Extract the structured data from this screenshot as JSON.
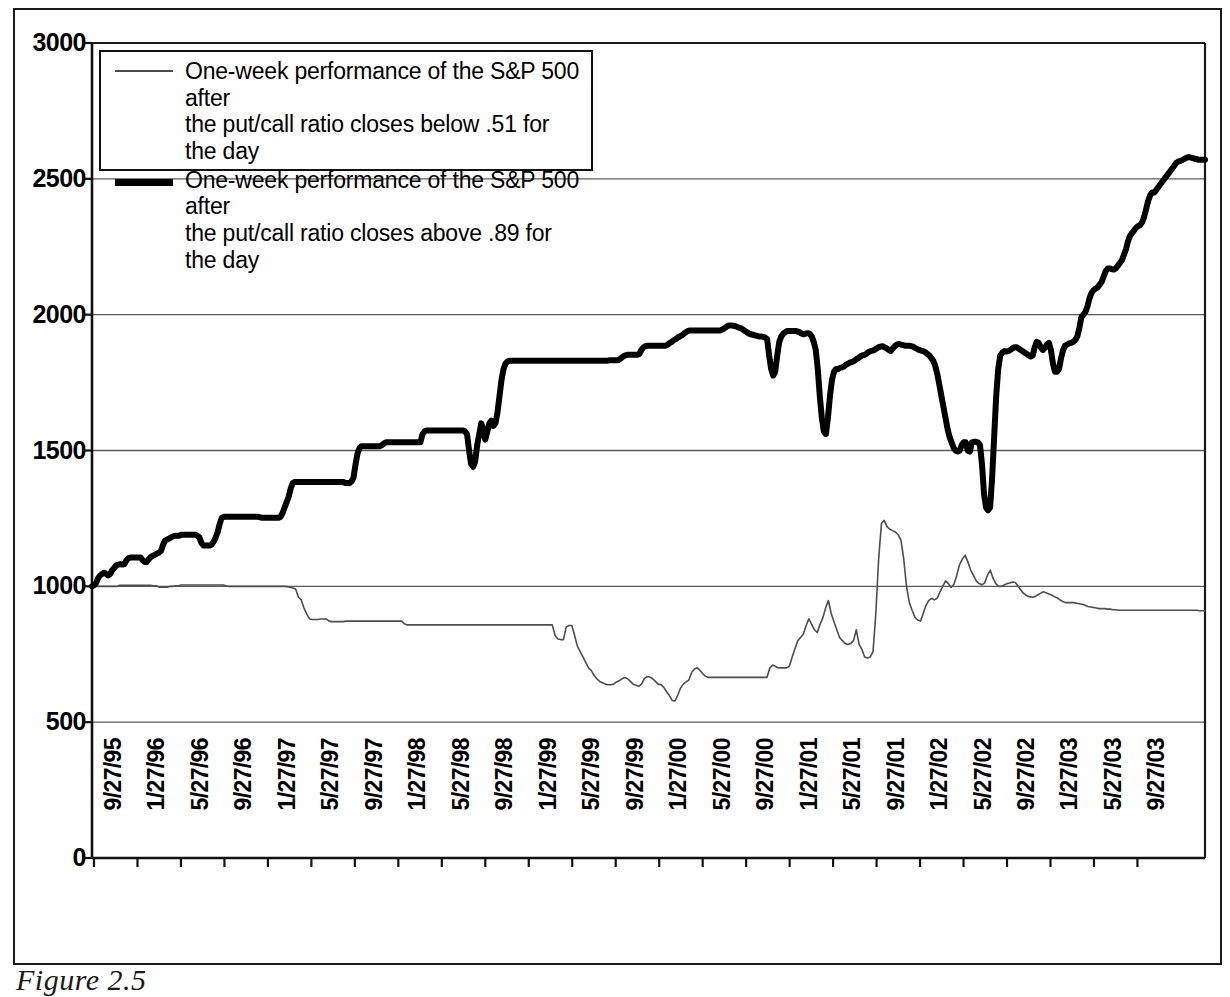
{
  "figure": {
    "caption": "Figure 2.5"
  },
  "legend": {
    "position": "top-left",
    "entries": [
      {
        "style": "thin",
        "line1": "One-week performance of the S&P 500 after",
        "line2": "the put/call ratio closes below .51 for the day",
        "color": "#4d4d4d"
      },
      {
        "style": "thick",
        "line1": "One-week performance of the S&P 500 after",
        "line2": "the put/call ratio closes above .89 for the day",
        "color": "#000000"
      }
    ]
  },
  "chart_data": {
    "type": "line",
    "title": "",
    "subtitle": "",
    "xlabel": "",
    "ylabel": "",
    "grid": "horizontal",
    "ylim": [
      0,
      3000
    ],
    "yticks": [
      0,
      500,
      1000,
      1500,
      2000,
      2500,
      3000
    ],
    "ytick_labels": [
      "0",
      "500",
      "1000",
      "1500",
      "2000",
      "2500",
      "3000"
    ],
    "xtick_labels": [
      "9/27/95",
      "1/27/96",
      "5/27/96",
      "9/27/96",
      "1/27/97",
      "5/27/97",
      "9/27/97",
      "1/27/98",
      "5/27/98",
      "9/27/98",
      "1/27/99",
      "5/27/99",
      "9/27/99",
      "1/27/00",
      "5/27/00",
      "9/27/00",
      "1/27/01",
      "5/27/01",
      "9/27/01",
      "1/27/02",
      "5/27/02",
      "9/27/02",
      "1/27/03",
      "5/27/03",
      "9/27/03"
    ],
    "x_start": "9/27/95",
    "x_end": "1/27/04",
    "series": [
      {
        "name": "One-week performance of the S&P 500 after the put/call ratio closes below .51 for the day",
        "style": "thin",
        "color": "#4d4d4d",
        "line_width": 1.6,
        "start_value": 1000,
        "end_value": 910,
        "min_value": 578,
        "max_value": 1243,
        "values": [
          1000,
          1000,
          1000,
          1000,
          1000,
          1000,
          1000,
          1000,
          1000,
          1000,
          1004,
          1004,
          1004,
          1004,
          1004,
          1004,
          1004,
          1004,
          1004,
          1004,
          1004,
          1004,
          1002,
          1002,
          997,
          997,
          997,
          997,
          1000,
          1000,
          1002,
          1002,
          1005,
          1005,
          1005,
          1005,
          1005,
          1005,
          1005,
          1005,
          1005,
          1005,
          1005,
          1005,
          1005,
          1005,
          1005,
          1005,
          1002,
          1000,
          1000,
          1000,
          1000,
          1000,
          1000,
          1000,
          1000,
          1000,
          1000,
          1000,
          1000,
          1000,
          1000,
          1000,
          1000,
          1000,
          1000,
          1000,
          1000,
          1000,
          999,
          997,
          994,
          990,
          960,
          950,
          920,
          898,
          880,
          878,
          878,
          878,
          880,
          880,
          880,
          872,
          870,
          870,
          870,
          870,
          870,
          872,
          872,
          872,
          872,
          872,
          872,
          872,
          872,
          872,
          872,
          872,
          872,
          872,
          872,
          872,
          872,
          872,
          872,
          872,
          872,
          872,
          862,
          858,
          858,
          858,
          858,
          858,
          858,
          858,
          858,
          858,
          858,
          858,
          858,
          858,
          858,
          858,
          858,
          858,
          858,
          858,
          858,
          858,
          858,
          858,
          858,
          858,
          858,
          858,
          858,
          858,
          858,
          858,
          858,
          858,
          858,
          858,
          858,
          858,
          858,
          858,
          858,
          858,
          858,
          858,
          858,
          858,
          858,
          858,
          858,
          858,
          858,
          858,
          858,
          858,
          820,
          806,
          804,
          804,
          850,
          856,
          856,
          820,
          780,
          760,
          740,
          720,
          700,
          690,
          672,
          660,
          650,
          645,
          640,
          638,
          638,
          640,
          648,
          652,
          660,
          664,
          660,
          650,
          640,
          636,
          632,
          640,
          660,
          668,
          666,
          660,
          650,
          640,
          638,
          628,
          612,
          598,
          580,
          578,
          600,
          626,
          640,
          648,
          656,
          684,
          696,
          700,
          690,
          678,
          668,
          665,
          665,
          665,
          665,
          665,
          665,
          665,
          665,
          665,
          665,
          665,
          665,
          665,
          665,
          665,
          665,
          665,
          665,
          665,
          665,
          665,
          665,
          700,
          710,
          706,
          700,
          700,
          700,
          700,
          706,
          740,
          770,
          800,
          812,
          824,
          856,
          880,
          860,
          840,
          830,
          860,
          884,
          920,
          948,
          900,
          870,
          840,
          812,
          800,
          790,
          786,
          790,
          800,
          840,
          786,
          768,
          740,
          736,
          740,
          760,
          900,
          1100,
          1230,
          1243,
          1220,
          1210,
          1205,
          1200,
          1190,
          1170,
          1100,
          1000,
          940,
          912,
          886,
          876,
          872,
          900,
          930,
          948,
          956,
          950,
          956,
          980,
          1000,
          1020,
          1010,
          996,
          1008,
          1040,
          1080,
          1100,
          1115,
          1090,
          1060,
          1040,
          1020,
          1010,
          1006,
          1012,
          1040,
          1060,
          1030,
          1010,
          1000,
          1000,
          1005,
          1010,
          1012,
          1016,
          1014,
          1000,
          986,
          974,
          966,
          962,
          960,
          962,
          968,
          974,
          980,
          976,
          972,
          968,
          962,
          958,
          950,
          944,
          940,
          940,
          940,
          940,
          938,
          936,
          934,
          930,
          926,
          924,
          922,
          920,
          918,
          918,
          918,
          916,
          916,
          914,
          914,
          912,
          912,
          912,
          912,
          912,
          912,
          912,
          912,
          912,
          912,
          912,
          912,
          912,
          912,
          912,
          912,
          912,
          912,
          912,
          912,
          912,
          912,
          912,
          912,
          912,
          912,
          912,
          912,
          912,
          910,
          910,
          910
        ]
      },
      {
        "name": "One-week performance of the S&P 500 after the put/call ratio closes above .89 for the day",
        "style": "thick",
        "color": "#000000",
        "line_width": 6,
        "start_value": 1000,
        "end_value": 2570,
        "min_value": 1000,
        "max_value": 2580,
        "values": [
          1000,
          1004,
          1012,
          1030,
          1040,
          1046,
          1050,
          1046,
          1040,
          1046,
          1060,
          1068,
          1078,
          1080,
          1082,
          1080,
          1082,
          1096,
          1104,
          1106,
          1106,
          1106,
          1106,
          1106,
          1106,
          1096,
          1090,
          1090,
          1100,
          1108,
          1112,
          1116,
          1120,
          1124,
          1130,
          1152,
          1168,
          1172,
          1176,
          1180,
          1184,
          1186,
          1186,
          1186,
          1190,
          1190,
          1190,
          1190,
          1190,
          1190,
          1190,
          1190,
          1186,
          1180,
          1160,
          1150,
          1150,
          1150,
          1150,
          1154,
          1164,
          1180,
          1200,
          1230,
          1252,
          1256,
          1256,
          1256,
          1256,
          1256,
          1256,
          1256,
          1256,
          1256,
          1256,
          1256,
          1256,
          1256,
          1256,
          1256,
          1256,
          1256,
          1256,
          1254,
          1252,
          1252,
          1252,
          1252,
          1252,
          1252,
          1252,
          1252,
          1252,
          1256,
          1270,
          1290,
          1310,
          1330,
          1360,
          1380,
          1384,
          1384,
          1384,
          1384,
          1384,
          1384,
          1384,
          1384,
          1384,
          1384,
          1384,
          1384,
          1384,
          1384,
          1384,
          1384,
          1384,
          1384,
          1384,
          1384,
          1384,
          1384,
          1384,
          1384,
          1384,
          1380,
          1380,
          1380,
          1386,
          1400,
          1450,
          1490,
          1510,
          1516,
          1516,
          1516,
          1516,
          1516,
          1516,
          1516,
          1516,
          1516,
          1516,
          1520,
          1526,
          1530,
          1530,
          1530,
          1530,
          1530,
          1530,
          1530,
          1530,
          1530,
          1530,
          1530,
          1530,
          1530,
          1530,
          1530,
          1530,
          1530,
          1530,
          1560,
          1570,
          1574,
          1574,
          1574,
          1574,
          1574,
          1574,
          1574,
          1574,
          1574,
          1574,
          1574,
          1574,
          1574,
          1574,
          1574,
          1574,
          1574,
          1574,
          1574,
          1570,
          1560,
          1500,
          1450,
          1440,
          1460,
          1520,
          1560,
          1600,
          1575,
          1540,
          1570,
          1600,
          1610,
          1590,
          1600,
          1640,
          1700,
          1760,
          1800,
          1820,
          1828,
          1830,
          1830,
          1830,
          1830,
          1830,
          1830,
          1830,
          1830,
          1830,
          1830,
          1830,
          1830,
          1830,
          1830,
          1830,
          1830,
          1830,
          1830,
          1830,
          1830,
          1830,
          1830,
          1830,
          1830,
          1830,
          1830,
          1830,
          1830,
          1830,
          1830,
          1830,
          1830,
          1830,
          1830,
          1830,
          1830,
          1830,
          1830,
          1830,
          1830,
          1830,
          1830,
          1830,
          1830,
          1830,
          1830,
          1830,
          1830,
          1830,
          1832,
          1832,
          1832,
          1832,
          1832,
          1834,
          1840,
          1846,
          1850,
          1852,
          1852,
          1852,
          1852,
          1852,
          1852,
          1856,
          1870,
          1880,
          1884,
          1886,
          1886,
          1886,
          1886,
          1886,
          1886,
          1886,
          1886,
          1886,
          1886,
          1890,
          1896,
          1900,
          1906,
          1910,
          1916,
          1920,
          1924,
          1930,
          1936,
          1940,
          1942,
          1942,
          1942,
          1942,
          1942,
          1942,
          1942,
          1942,
          1942,
          1942,
          1942,
          1942,
          1942,
          1942,
          1942,
          1942,
          1946,
          1950,
          1956,
          1960,
          1960,
          1960,
          1958,
          1956,
          1952,
          1950,
          1946,
          1940,
          1936,
          1930,
          1928,
          1926,
          1924,
          1922,
          1920,
          1920,
          1918,
          1916,
          1910,
          1850,
          1800,
          1776,
          1790,
          1850,
          1900,
          1920,
          1930,
          1936,
          1940,
          1940,
          1940,
          1940,
          1940,
          1938,
          1936,
          1930,
          1928,
          1930,
          1932,
          1930,
          1920,
          1900,
          1870,
          1800,
          1700,
          1620,
          1570,
          1560,
          1620,
          1700,
          1760,
          1790,
          1800,
          1800,
          1804,
          1806,
          1810,
          1816,
          1820,
          1824,
          1826,
          1830,
          1836,
          1840,
          1846,
          1850,
          1852,
          1856,
          1862,
          1866,
          1868,
          1870,
          1876,
          1880,
          1882,
          1884,
          1880,
          1876,
          1870,
          1866,
          1876,
          1884,
          1890,
          1892,
          1890,
          1888,
          1886,
          1886,
          1886,
          1884,
          1882,
          1878,
          1874,
          1870,
          1868,
          1866,
          1862,
          1856,
          1850,
          1840,
          1830,
          1810,
          1780,
          1740,
          1700,
          1660,
          1620,
          1580,
          1550,
          1530,
          1510,
          1500,
          1496,
          1500,
          1520,
          1530,
          1530,
          1500,
          1496,
          1530,
          1532,
          1532,
          1530,
          1520,
          1450,
          1340,
          1290,
          1280,
          1290,
          1400,
          1550,
          1700,
          1800,
          1850,
          1860,
          1866,
          1864,
          1866,
          1870,
          1876,
          1880,
          1880,
          1876,
          1870,
          1866,
          1860,
          1856,
          1850,
          1846,
          1850,
          1880,
          1900,
          1896,
          1880,
          1870,
          1878,
          1890,
          1896,
          1870,
          1820,
          1790,
          1790,
          1800,
          1840,
          1870,
          1886,
          1890,
          1894,
          1896,
          1900,
          1906,
          1920,
          1950,
          1990,
          2000,
          2010,
          2030,
          2060,
          2080,
          2090,
          2096,
          2100,
          2110,
          2120,
          2140,
          2160,
          2170,
          2170,
          2168,
          2166,
          2170,
          2180,
          2190,
          2200,
          2220,
          2240,
          2270,
          2290,
          2300,
          2310,
          2320,
          2326,
          2330,
          2340,
          2360,
          2390,
          2420,
          2440,
          2450,
          2450,
          2460,
          2470,
          2480,
          2490,
          2500,
          2510,
          2520,
          2530,
          2540,
          2550,
          2560,
          2564,
          2566,
          2570,
          2574,
          2578,
          2580,
          2578,
          2576,
          2574,
          2572,
          2570,
          2570,
          2570,
          2570
        ]
      }
    ]
  }
}
